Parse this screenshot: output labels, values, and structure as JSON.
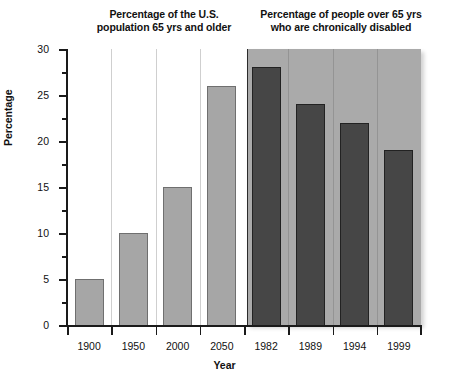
{
  "chart_data": {
    "type": "bar",
    "title": "",
    "xlabel": "Year",
    "ylabel": "Percentage",
    "ylim": [
      0,
      30
    ],
    "ytick_values": [
      0,
      5,
      10,
      15,
      20,
      25,
      30
    ],
    "ytick_labels": [
      "0",
      "5",
      "10",
      "15",
      "20",
      "25",
      "30"
    ],
    "yminor_step": 2.5,
    "grid": "vertical-category-separators",
    "legend": "none",
    "categories": [
      "1900",
      "1950",
      "2000",
      "2050",
      "1982",
      "1989",
      "1994",
      "1999"
    ],
    "values": [
      5,
      10,
      15,
      26,
      28,
      24,
      22,
      19
    ],
    "panels": [
      {
        "id": "left",
        "title_lines": [
          "Percentage of the U.S.",
          "population 65 yrs and older"
        ],
        "background": "#ffffff",
        "bar_color": "#a6a6a6",
        "categories": [
          "1900",
          "1950",
          "2000",
          "2050"
        ],
        "values": [
          5,
          10,
          15,
          26
        ]
      },
      {
        "id": "right",
        "title_lines": [
          "Percentage of people over 65 yrs",
          "who are chronically disabled"
        ],
        "background": "#aaaaaa",
        "bar_color": "#464646",
        "categories": [
          "1982",
          "1989",
          "1994",
          "1999"
        ],
        "values": [
          28,
          24,
          22,
          19
        ]
      }
    ]
  },
  "axes": {
    "y_title": "Percentage",
    "x_title": "Year",
    "y_labels": [
      "30",
      "25",
      "20",
      "15",
      "10",
      "5",
      "0"
    ],
    "x_labels": [
      "1900",
      "1950",
      "2000",
      "2050",
      "1982",
      "1989",
      "1994",
      "1999"
    ]
  },
  "titles": {
    "left_line1": "Percentage of the U.S.",
    "left_line2": "population 65 yrs and older",
    "right_line1": "Percentage of people over 65 yrs",
    "right_line2": "who are chronically disabled"
  },
  "colors": {
    "light_bar": "#a6a6a6",
    "dark_bar": "#464646",
    "right_panel_bg": "#aaaaaa",
    "left_panel_bg": "#ffffff",
    "axis": "#1a1a1a",
    "gridline": "#cfcfcf"
  }
}
